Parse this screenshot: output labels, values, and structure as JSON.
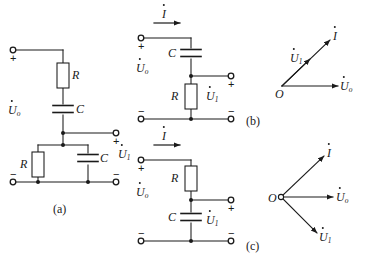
{
  "figure": {
    "kind": "rc-network-circuits-and-phasor-diagrams",
    "subfigure_labels": {
      "a": "(a)",
      "b": "(b)",
      "c": "(c)"
    }
  },
  "symbols": {
    "resistor": "R",
    "capacitor": "C",
    "current": "I",
    "v_in": "U",
    "v_in_sub": "o",
    "v_out": "U",
    "v_out_sub": "1",
    "origin": "O",
    "plus": "+",
    "minus": "−"
  },
  "circuit_a": {
    "name": "band-pass-rc-network",
    "input_plus": "+",
    "input_minus": "−",
    "output_plus": "+",
    "output_minus": "−",
    "series_resistor": "R",
    "series_capacitor": "C",
    "shunt_resistor": "R",
    "shunt_capacitor": "C",
    "input_label": "U",
    "input_sub": "o",
    "output_label": "U",
    "output_sub": "1",
    "caption": "(a)"
  },
  "circuit_b": {
    "name": "high-pass-rc-section",
    "current_label": "I",
    "input_plus": "+",
    "input_minus": "−",
    "output_plus": "+",
    "output_minus": "−",
    "series_capacitor": "C",
    "shunt_resistor": "R",
    "input_label": "U",
    "input_sub": "o",
    "output_label": "U",
    "output_sub": "1"
  },
  "circuit_c": {
    "name": "low-pass-rc-section",
    "current_label": "I",
    "input_plus": "+",
    "input_minus": "−",
    "output_plus": "+",
    "output_minus": "−",
    "series_resistor": "R",
    "shunt_capacitor": "C",
    "input_label": "U",
    "input_sub": "o",
    "output_label": "U",
    "output_sub": "1"
  },
  "phasor_b": {
    "name": "phasor-diagram-high-pass",
    "origin": "O",
    "caption": "(b)",
    "vectors": [
      {
        "label": "U",
        "sub": "o",
        "angle_deg": 0,
        "length": 86,
        "note": "reference-input-phasor-horizontal"
      },
      {
        "label": "I",
        "sub": "",
        "angle_deg": 42,
        "length": 78,
        "note": "current-leads-input"
      },
      {
        "label": "U",
        "sub": "1",
        "angle_deg": 42,
        "length": 44,
        "note": "output-in-phase-with-current"
      }
    ]
  },
  "phasor_c": {
    "name": "phasor-diagram-low-pass",
    "origin": "O",
    "caption": "(c)",
    "vectors": [
      {
        "label": "U",
        "sub": "o",
        "angle_deg": 0,
        "length": 80,
        "note": "reference-input-phasor-horizontal"
      },
      {
        "label": "I",
        "sub": "",
        "angle_deg": 44,
        "length": 74,
        "note": "current-leads-input"
      },
      {
        "label": "U",
        "sub": "1",
        "angle_deg": -42,
        "length": 70,
        "note": "output-lags-input"
      }
    ]
  },
  "style": {
    "wire_color": "#1a1a1a",
    "text_color": "#1a1a1a",
    "background": "#ffffff"
  }
}
